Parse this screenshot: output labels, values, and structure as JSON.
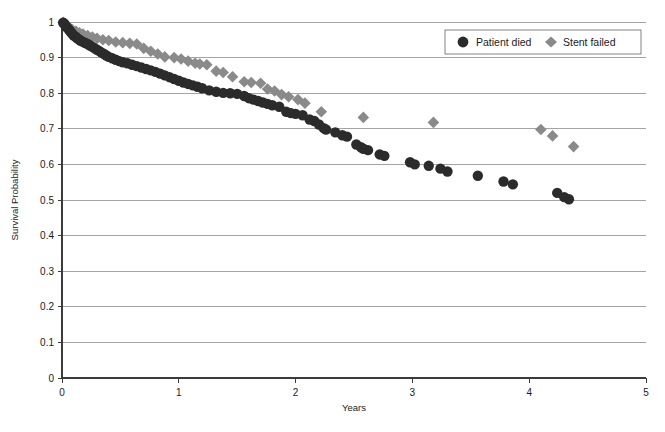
{
  "chart_data": {
    "type": "scatter",
    "title": "",
    "xlabel": "Years",
    "ylabel": "Survival Probability",
    "xlim": [
      0,
      5
    ],
    "ylim": [
      0,
      1
    ],
    "xticks": [
      "0",
      "1",
      "2",
      "3",
      "4",
      "5"
    ],
    "xtick_values": [
      0,
      1,
      2,
      3,
      4,
      5
    ],
    "yticks": [
      "0",
      "0.1",
      "0.2",
      "0.3",
      "0.4",
      "0.5",
      "0.6",
      "0.7",
      "0.8",
      "0.9",
      "1"
    ],
    "ytick_values": [
      0,
      0.1,
      0.2,
      0.3,
      0.4,
      0.5,
      0.6,
      0.7,
      0.8,
      0.9,
      1.0
    ],
    "grid": "horizontal",
    "legend_position": "top-right",
    "series": [
      {
        "name": "Patient died",
        "marker": "circle",
        "color": "#2b2b2b",
        "points": [
          [
            0.01,
            0.998
          ],
          [
            0.02,
            0.995
          ],
          [
            0.03,
            0.99
          ],
          [
            0.04,
            0.986
          ],
          [
            0.05,
            0.982
          ],
          [
            0.06,
            0.978
          ],
          [
            0.07,
            0.974
          ],
          [
            0.08,
            0.97
          ],
          [
            0.09,
            0.966
          ],
          [
            0.1,
            0.962
          ],
          [
            0.12,
            0.958
          ],
          [
            0.13,
            0.954
          ],
          [
            0.15,
            0.95
          ],
          [
            0.16,
            0.947
          ],
          [
            0.18,
            0.944
          ],
          [
            0.2,
            0.941
          ],
          [
            0.22,
            0.938
          ],
          [
            0.24,
            0.934
          ],
          [
            0.26,
            0.93
          ],
          [
            0.28,
            0.926
          ],
          [
            0.3,
            0.922
          ],
          [
            0.32,
            0.918
          ],
          [
            0.34,
            0.914
          ],
          [
            0.36,
            0.91
          ],
          [
            0.38,
            0.906
          ],
          [
            0.4,
            0.902
          ],
          [
            0.43,
            0.898
          ],
          [
            0.46,
            0.894
          ],
          [
            0.49,
            0.89
          ],
          [
            0.52,
            0.887
          ],
          [
            0.56,
            0.884
          ],
          [
            0.6,
            0.88
          ],
          [
            0.64,
            0.876
          ],
          [
            0.68,
            0.872
          ],
          [
            0.72,
            0.868
          ],
          [
            0.76,
            0.864
          ],
          [
            0.8,
            0.86
          ],
          [
            0.84,
            0.855
          ],
          [
            0.88,
            0.85
          ],
          [
            0.92,
            0.845
          ],
          [
            0.96,
            0.84
          ],
          [
            1.0,
            0.835
          ],
          [
            1.04,
            0.83
          ],
          [
            1.08,
            0.826
          ],
          [
            1.12,
            0.822
          ],
          [
            1.16,
            0.818
          ],
          [
            1.2,
            0.814
          ],
          [
            1.26,
            0.808
          ],
          [
            1.32,
            0.804
          ],
          [
            1.38,
            0.801
          ],
          [
            1.44,
            0.8
          ],
          [
            1.5,
            0.798
          ],
          [
            1.56,
            0.792
          ],
          [
            1.6,
            0.786
          ],
          [
            1.64,
            0.782
          ],
          [
            1.68,
            0.778
          ],
          [
            1.72,
            0.774
          ],
          [
            1.76,
            0.77
          ],
          [
            1.8,
            0.766
          ],
          [
            1.86,
            0.762
          ],
          [
            1.92,
            0.748
          ],
          [
            1.96,
            0.744
          ],
          [
            2.0,
            0.742
          ],
          [
            2.06,
            0.738
          ],
          [
            2.12,
            0.726
          ],
          [
            2.16,
            0.722
          ],
          [
            2.2,
            0.712
          ],
          [
            2.24,
            0.702
          ],
          [
            2.26,
            0.698
          ],
          [
            2.34,
            0.69
          ],
          [
            2.4,
            0.682
          ],
          [
            2.44,
            0.678
          ],
          [
            2.52,
            0.656
          ],
          [
            2.56,
            0.648
          ],
          [
            2.58,
            0.644
          ],
          [
            2.62,
            0.64
          ],
          [
            2.72,
            0.628
          ],
          [
            2.76,
            0.624
          ],
          [
            2.98,
            0.606
          ],
          [
            3.02,
            0.6
          ],
          [
            3.14,
            0.596
          ],
          [
            3.24,
            0.588
          ],
          [
            3.3,
            0.58
          ],
          [
            3.56,
            0.568
          ],
          [
            3.78,
            0.552
          ],
          [
            3.86,
            0.544
          ],
          [
            4.24,
            0.52
          ],
          [
            4.3,
            0.508
          ],
          [
            4.34,
            0.502
          ]
        ]
      },
      {
        "name": "Stent failed",
        "marker": "diamond",
        "color": "#8a8a8a",
        "points": [
          [
            0.01,
            0.999
          ],
          [
            0.03,
            0.994
          ],
          [
            0.05,
            0.988
          ],
          [
            0.07,
            0.982
          ],
          [
            0.09,
            0.978
          ],
          [
            0.12,
            0.974
          ],
          [
            0.15,
            0.97
          ],
          [
            0.18,
            0.966
          ],
          [
            0.22,
            0.962
          ],
          [
            0.26,
            0.958
          ],
          [
            0.3,
            0.954
          ],
          [
            0.35,
            0.95
          ],
          [
            0.4,
            0.948
          ],
          [
            0.46,
            0.944
          ],
          [
            0.52,
            0.942
          ],
          [
            0.58,
            0.94
          ],
          [
            0.64,
            0.938
          ],
          [
            0.7,
            0.926
          ],
          [
            0.76,
            0.918
          ],
          [
            0.82,
            0.91
          ],
          [
            0.88,
            0.902
          ],
          [
            0.96,
            0.9
          ],
          [
            1.02,
            0.896
          ],
          [
            1.08,
            0.89
          ],
          [
            1.14,
            0.884
          ],
          [
            1.18,
            0.882
          ],
          [
            1.24,
            0.88
          ],
          [
            1.32,
            0.862
          ],
          [
            1.38,
            0.858
          ],
          [
            1.46,
            0.846
          ],
          [
            1.56,
            0.832
          ],
          [
            1.62,
            0.83
          ],
          [
            1.7,
            0.828
          ],
          [
            1.76,
            0.812
          ],
          [
            1.82,
            0.806
          ],
          [
            1.88,
            0.796
          ],
          [
            1.94,
            0.79
          ],
          [
            2.02,
            0.782
          ],
          [
            2.08,
            0.772
          ],
          [
            2.22,
            0.748
          ],
          [
            2.58,
            0.732
          ],
          [
            3.18,
            0.718
          ],
          [
            4.1,
            0.698
          ],
          [
            4.2,
            0.68
          ],
          [
            4.38,
            0.65
          ]
        ]
      }
    ]
  },
  "legend": {
    "entries": [
      {
        "label": "Patient died",
        "marker": "circle",
        "color": "#2b2b2b"
      },
      {
        "label": "Stent failed",
        "marker": "diamond",
        "color": "#8a8a8a"
      }
    ]
  },
  "axes": {
    "x_title": "Years",
    "y_title": "Survival Probability"
  }
}
